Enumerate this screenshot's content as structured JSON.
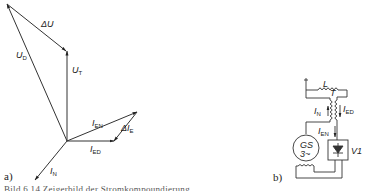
{
  "figure": {
    "panel_a": {
      "label": "a)",
      "vectors": [
        {
          "id": "U_D",
          "main": "U",
          "sub": "D"
        },
        {
          "id": "dU",
          "main": "ΔU",
          "sub": ""
        },
        {
          "id": "U_T",
          "main": "U",
          "sub": "T"
        },
        {
          "id": "I_EN",
          "main": "I",
          "sub": "EN"
        },
        {
          "id": "dI_E",
          "main": "ΔI",
          "sub": "E"
        },
        {
          "id": "I_ED",
          "main": "I",
          "sub": "ED"
        },
        {
          "id": "I_N",
          "main": "I",
          "sub": "N"
        }
      ]
    },
    "panel_b": {
      "label": "b)",
      "components": {
        "inductor": "L",
        "transformer": "T",
        "generator_top": "GS",
        "generator_bottom": "3~",
        "rectifier": "V1"
      },
      "currents": [
        {
          "main": "I",
          "sub": "N"
        },
        {
          "main": "I",
          "sub": "ED"
        },
        {
          "main": "I",
          "sub": "EN"
        }
      ]
    },
    "caption": "Bild 6.14 Zeigerbild der Stromkompoundierung"
  }
}
